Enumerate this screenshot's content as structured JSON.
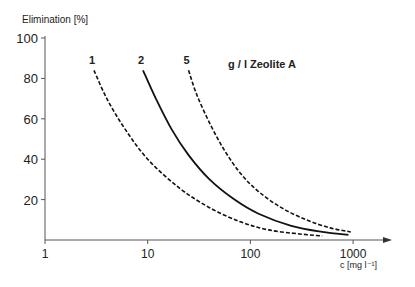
{
  "chart_data": {
    "type": "line",
    "title": "",
    "ylabel": "Elimination [%]",
    "xlabel": "c [mg l⁻¹]",
    "xscale": "log",
    "xlim": [
      1,
      2000
    ],
    "ylim": [
      0,
      100
    ],
    "x_ticks": [
      "1",
      "10",
      "100",
      "1000"
    ],
    "y_ticks": [
      "20",
      "40",
      "60",
      "80",
      "100"
    ],
    "legend_suffix": "g / l Zeolite A",
    "series": [
      {
        "name": "1",
        "style": "dashed",
        "x": [
          3,
          4,
          6,
          10,
          20,
          40,
          80,
          150,
          300,
          500
        ],
        "y": [
          84,
          70,
          55,
          40,
          26,
          16,
          9,
          5,
          3,
          2
        ]
      },
      {
        "name": "2",
        "style": "solid",
        "x": [
          9,
          12,
          17,
          25,
          40,
          70,
          120,
          250,
          500,
          900
        ],
        "y": [
          84,
          70,
          55,
          42,
          30,
          20,
          13,
          7,
          4,
          2.5
        ]
      },
      {
        "name": "5",
        "style": "dashed",
        "x": [
          25,
          30,
          40,
          55,
          80,
          120,
          200,
          350,
          600,
          950
        ],
        "y": [
          84,
          72,
          58,
          45,
          33,
          24,
          16,
          10,
          6,
          4
        ]
      }
    ]
  }
}
